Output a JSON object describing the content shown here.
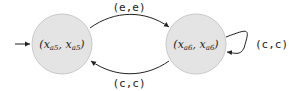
{
  "diagram": {
    "type": "state-machine",
    "states": [
      {
        "id": "s0",
        "name": "x",
        "sub": "a5",
        "label": "(x_a5, x_a5)",
        "initial": true,
        "fill": "#e4e4e4",
        "stroke": "#c8c8c8"
      },
      {
        "id": "s1",
        "name": "x",
        "sub": "a6",
        "label": "(x_a6, x_a6)",
        "initial": false,
        "fill": "#e4e4e4",
        "stroke": "#c8c8c8"
      }
    ],
    "transitions": [
      {
        "from": "s0",
        "to": "s1",
        "label": "(e,e)"
      },
      {
        "from": "s1",
        "to": "s0",
        "label": "(c,c)"
      },
      {
        "from": "s1",
        "to": "s1",
        "label": "(c,c)"
      }
    ],
    "text": {
      "s0_open": "(",
      "s0_var1": "x",
      "s0_sub1": "a5",
      "s0_comma": ", ",
      "s0_var2": "x",
      "s0_sub2": "a5",
      "s0_close": ")",
      "s1_open": "(",
      "s1_var1": "x",
      "s1_sub1": "a6",
      "s1_comma": ", ",
      "s1_var2": "x",
      "s1_sub2": "a6",
      "s1_close": ")",
      "edge_top": "(e,e)",
      "edge_bottom": "(c,c)",
      "edge_loop": "(c,c)"
    }
  }
}
